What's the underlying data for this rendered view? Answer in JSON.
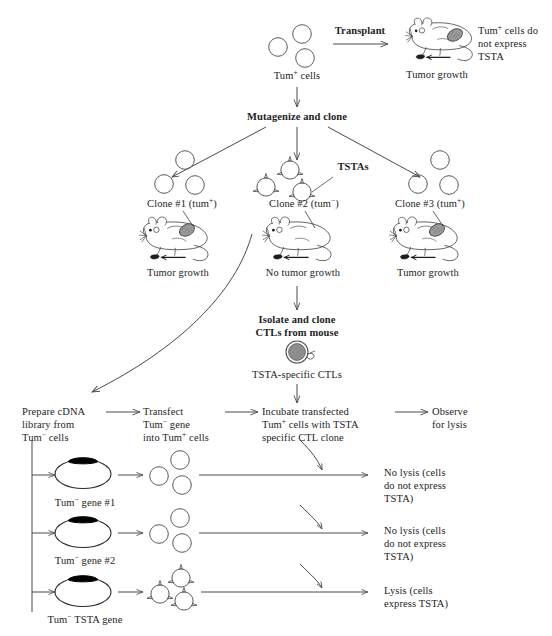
{
  "figure": {
    "type": "flow-diagram"
  },
  "top": {
    "tum_plus_cells_label": "Tum+ cells",
    "transplant_label": "Transplant",
    "tumor_growth_label": "Tumor growth",
    "no_express_note": "Tum+ cells do\nnot express\nTSTA",
    "mutagenize_label": "Mutagenize and clone"
  },
  "clones": [
    {
      "name": "Clone #1 (tum+)",
      "outcome": "Tumor growth",
      "cell_type": "plain"
    },
    {
      "name": "Clone #2 (tum-)",
      "outcome": "No tumor growth",
      "cell_type": "spiked"
    },
    {
      "name": "Clone #3 (tum+)",
      "outcome": "Tumor growth",
      "cell_type": "plain"
    }
  ],
  "tstas_label": "TSTAs",
  "ctl": {
    "isolate_label": "Isolate and clone\nCTLs from mouse",
    "ctl_caption": "TSTA-specific CTLs"
  },
  "workflow": [
    {
      "text": "Prepare cDNA\nlibrary from\nTum- cells"
    },
    {
      "text": "Transfect\nTum- gene\ninto Tum+ cells"
    },
    {
      "text": "Incubate transfected\nTum+ cells with TSTA\nspecific CTL clone"
    },
    {
      "text": "Observe\nfor lysis"
    }
  ],
  "assay_rows": [
    {
      "gene_label": "Tum- gene #1",
      "cell_type": "plain",
      "result": "No lysis (cells\ndo not express\nTSTA)"
    },
    {
      "gene_label": "Tum- gene #2",
      "cell_type": "plain",
      "result": "No lysis (cells\ndo not express\nTSTA)"
    },
    {
      "gene_label": "Tum- TSTA gene",
      "cell_type": "spiked",
      "result": "Lysis (cells\nexpress TSTA)"
    }
  ],
  "colors": {
    "ink": "#1d1d1d",
    "line": "#4a4a4a",
    "cell_stroke": "#555555",
    "tumor_fill": "#9a9a9a",
    "plasmid_insert": "#000000",
    "ctl_fill": "#8e8e8e"
  }
}
